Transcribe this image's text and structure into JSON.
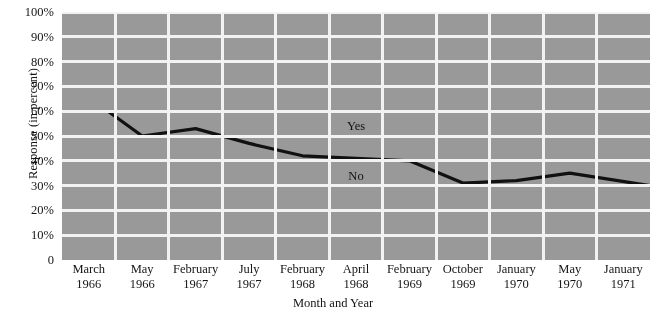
{
  "chart_data": {
    "type": "line",
    "title": "",
    "subtitle": "",
    "xlabel": "Month and Year",
    "ylabel": "Response (in percent)",
    "ylim": [
      0,
      100
    ],
    "ytick_labels": [
      "100%",
      "90%",
      "80%",
      "70%",
      "60%",
      "50%",
      "40%",
      "30%",
      "20%",
      "10%",
      "0"
    ],
    "ytick_values": [
      100,
      90,
      80,
      70,
      60,
      50,
      40,
      30,
      20,
      10,
      0
    ],
    "grid": true,
    "legend_position": "inline-annotations",
    "categories": [
      "March 1966",
      "May 1966",
      "February 1967",
      "July 1967",
      "February 1968",
      "April 1968",
      "February 1969",
      "October 1969",
      "January 1970",
      "May 1970",
      "January 1971"
    ],
    "xtick_months": [
      "March",
      "May",
      "February",
      "July",
      "February",
      "April",
      "February",
      "October",
      "January",
      "May",
      "January"
    ],
    "xtick_years": [
      "1966",
      "1966",
      "1967",
      "1967",
      "1968",
      "1968",
      "1969",
      "1969",
      "1970",
      "1970",
      "1971"
    ],
    "series": [
      {
        "name": "Yes",
        "values": [
          60,
          50,
          53,
          47,
          42,
          41,
          40,
          31,
          32,
          35,
          30
        ],
        "color": "#111111"
      }
    ],
    "annotations": [
      {
        "text": "Yes",
        "x_category": "April 1968",
        "y_value": 54
      },
      {
        "text": "No",
        "x_category": "April 1968",
        "y_value": 34
      }
    ],
    "plot_background_color": "#9a9a9a",
    "gridline_color": "#f2f2f2",
    "line_color": "#111111"
  }
}
